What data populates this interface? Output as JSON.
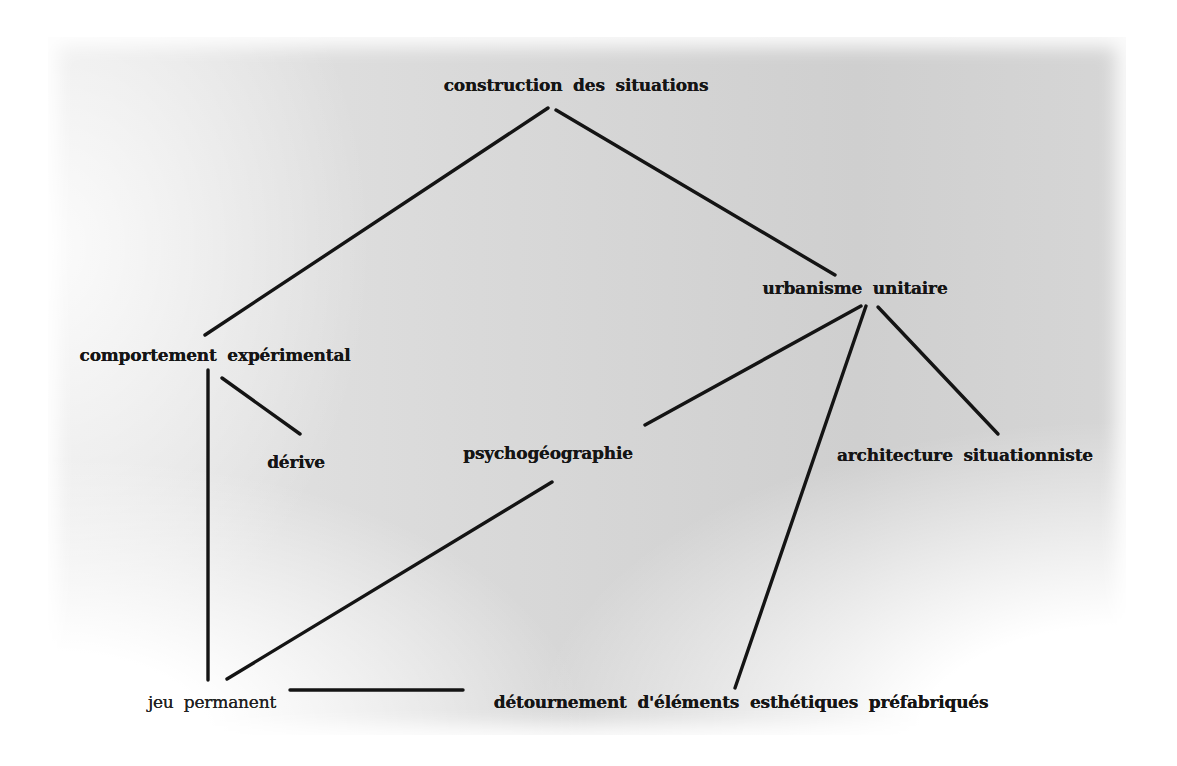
{
  "diagram": {
    "type": "concept-tree",
    "nodes": [
      {
        "id": "construction",
        "label": "construction des situations",
        "x": 576,
        "y": 85,
        "weight": "bold"
      },
      {
        "id": "urbanisme",
        "label": "urbanisme unitaire",
        "x": 855,
        "y": 288,
        "weight": "bold"
      },
      {
        "id": "comportement",
        "label": "comportement expérimental",
        "x": 215,
        "y": 355,
        "weight": "bold"
      },
      {
        "id": "derive",
        "label": "dérive",
        "x": 296,
        "y": 462,
        "weight": "bold"
      },
      {
        "id": "psychogeographie",
        "label": "psychogéographie",
        "x": 548,
        "y": 453,
        "weight": "bold"
      },
      {
        "id": "architecture",
        "label": "architecture situationniste",
        "x": 965,
        "y": 455,
        "weight": "bold"
      },
      {
        "id": "jeu",
        "label": "jeu permanent",
        "x": 212,
        "y": 702,
        "weight": "normal"
      },
      {
        "id": "detournement",
        "label": "détournement d'éléments esthétiques préfabriqués",
        "x": 741,
        "y": 702,
        "weight": "bold"
      }
    ],
    "edges": [
      {
        "from": "construction",
        "to": "comportement",
        "x1": 548,
        "y1": 108,
        "x2": 205,
        "y2": 335
      },
      {
        "from": "construction",
        "to": "urbanisme",
        "x1": 556,
        "y1": 110,
        "x2": 835,
        "y2": 275
      },
      {
        "from": "urbanisme",
        "to": "psychogeographie",
        "x1": 861,
        "y1": 306,
        "x2": 645,
        "y2": 425
      },
      {
        "from": "urbanisme",
        "to": "detournement",
        "x1": 866,
        "y1": 306,
        "x2": 735,
        "y2": 688
      },
      {
        "from": "urbanisme",
        "to": "architecture",
        "x1": 878,
        "y1": 307,
        "x2": 998,
        "y2": 434
      },
      {
        "from": "comportement",
        "to": "jeu",
        "x1": 208,
        "y1": 370,
        "x2": 208,
        "y2": 680
      },
      {
        "from": "comportement",
        "to": "derive",
        "x1": 222,
        "y1": 378,
        "x2": 300,
        "y2": 434
      },
      {
        "from": "psychogeographie",
        "to": "jeu",
        "x1": 552,
        "y1": 482,
        "x2": 227,
        "y2": 679
      },
      {
        "from": "jeu",
        "to": "detournement",
        "x1": 290,
        "y1": 690,
        "x2": 463,
        "y2": 690
      }
    ]
  },
  "colors": {
    "ink": "#151515",
    "paper_light": "#e6e6e6",
    "paper_dark": "#cfcfcf",
    "margin": "#ffffff"
  }
}
